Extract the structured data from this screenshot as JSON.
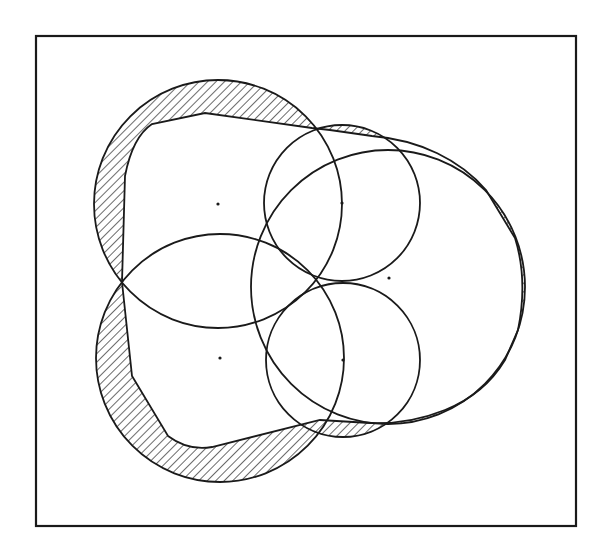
{
  "figure": {
    "width": 611,
    "height": 555,
    "frame": {
      "x": 36,
      "y": 36,
      "width": 540,
      "height": 490,
      "stroke": "#1a1a1a",
      "stroke_width": 2.2
    },
    "line_color": "#1a1a1a",
    "hatch": {
      "spacing": 6,
      "angle_deg": 45,
      "stroke_width": 1.3
    },
    "circles": [
      {
        "id": "upper-left-circle",
        "cx": 218,
        "cy": 204,
        "r": 124
      },
      {
        "id": "lower-left-circle",
        "cx": 220,
        "cy": 358,
        "r": 124
      },
      {
        "id": "upper-right-circle",
        "cx": 342,
        "cy": 203,
        "r": 78
      },
      {
        "id": "lower-right-circle",
        "cx": 343,
        "cy": 360,
        "r": 77
      },
      {
        "id": "large-right-circle",
        "cx": 388,
        "cy": 287,
        "r": 137
      }
    ],
    "center_points": [
      {
        "id": "center-upper-left",
        "x": 218,
        "y": 204
      },
      {
        "id": "center-lower-left",
        "x": 220,
        "y": 358
      },
      {
        "id": "center-upper-right",
        "x": 342,
        "y": 203
      },
      {
        "id": "center-right",
        "x": 389,
        "y": 278
      },
      {
        "id": "center-lower-right",
        "x": 343,
        "y": 360
      }
    ],
    "approximation_boundary": "M 122 282 L 125 176 C 130 150 140 132 152 124 L 205 113 L 312 128 L 330 130 L 372 136 C 420 140 460 160 486 190 L 515 238 C 525 270 524 300 518 330 L 505 360 C 490 385 470 400 445 410 C 420 420 395 424 370 423 L 320 420 L 212 447 C 195 450 180 445 168 436 L 132 376 Z",
    "hatched_regions": "union of circles minus approximation boundary"
  }
}
